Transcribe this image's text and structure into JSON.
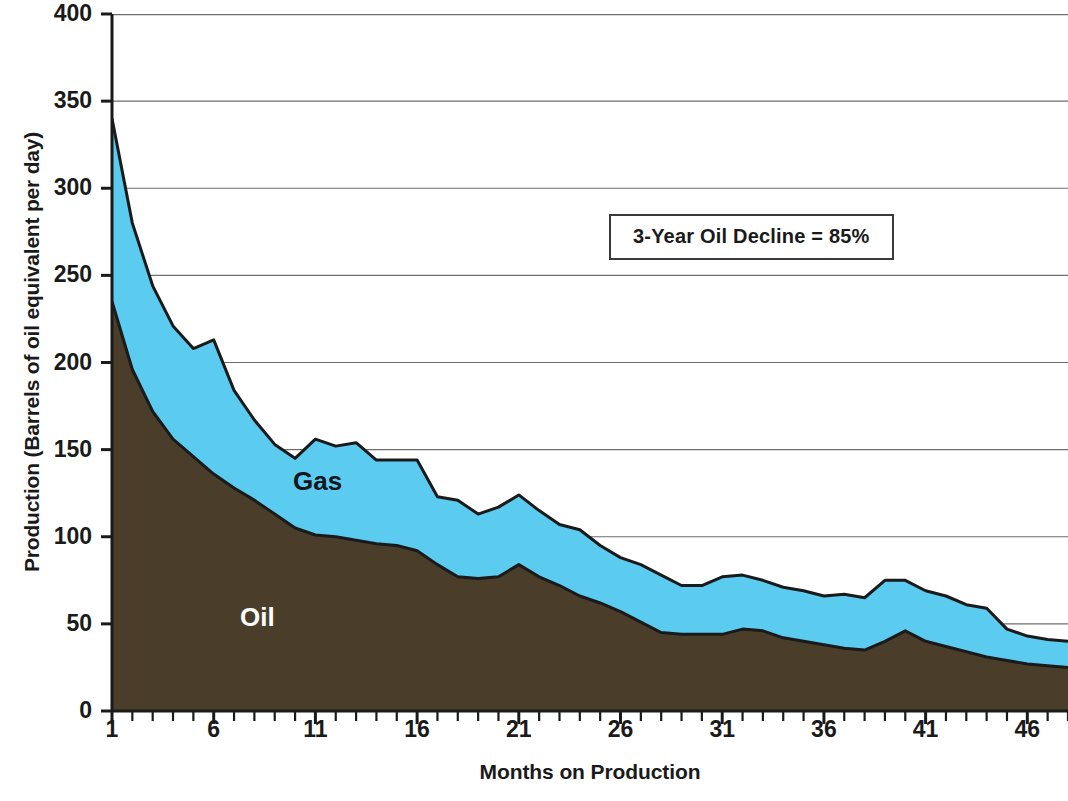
{
  "chart_data": {
    "type": "area",
    "stacked": true,
    "title": "",
    "xlabel": "Months on Production",
    "ylabel": "Production (Barrels of oil equivalent per day)",
    "xlim": [
      1,
      48
    ],
    "ylim": [
      0,
      400
    ],
    "ytick_labels": [
      "0",
      "50",
      "100",
      "150",
      "200",
      "250",
      "300",
      "350",
      "400"
    ],
    "ytick_values": [
      0,
      50,
      100,
      150,
      200,
      250,
      300,
      350,
      400
    ],
    "xtick_labels": [
      "1",
      "6",
      "11",
      "16",
      "21",
      "26",
      "31",
      "36",
      "41",
      "46"
    ],
    "xtick_values": [
      1,
      6,
      11,
      16,
      21,
      26,
      31,
      36,
      41,
      46
    ],
    "grid": "horizontal",
    "legend_position": "inline-labels",
    "x": [
      1,
      2,
      3,
      4,
      5,
      6,
      7,
      8,
      9,
      10,
      11,
      12,
      13,
      14,
      15,
      16,
      17,
      18,
      19,
      20,
      21,
      22,
      23,
      24,
      25,
      26,
      27,
      28,
      29,
      30,
      31,
      32,
      33,
      34,
      35,
      36,
      37,
      38,
      39,
      40,
      41,
      42,
      43,
      44,
      45,
      46,
      47,
      48
    ],
    "series": [
      {
        "name": "Oil",
        "color": "#4a3e2a",
        "label_color": "#ffffff",
        "values": [
          235,
          196,
          172,
          156,
          146,
          136,
          128,
          121,
          113,
          105,
          101,
          100,
          98,
          96,
          95,
          92,
          84,
          77,
          76,
          77,
          84,
          77,
          72,
          66,
          62,
          57,
          51,
          45,
          44,
          44,
          44,
          47,
          46,
          42,
          40,
          38,
          36,
          35,
          40,
          46,
          40,
          37,
          34,
          31,
          29,
          27,
          26,
          25
        ]
      },
      {
        "name": "Gas",
        "color": "#5bcbf0",
        "label_color": "#10161c",
        "values": [
          105,
          84,
          72,
          65,
          62,
          77,
          56,
          46,
          40,
          40,
          55,
          52,
          56,
          48,
          49,
          52,
          39,
          44,
          37,
          40,
          40,
          38,
          35,
          38,
          33,
          31,
          33,
          33,
          28,
          28,
          33,
          31,
          29,
          29,
          29,
          28,
          31,
          30,
          35,
          29,
          29,
          29,
          27,
          28,
          18,
          16,
          15,
          15
        ]
      }
    ],
    "totals": [
      340,
      280,
      244,
      221,
      208,
      213,
      184,
      167,
      153,
      145,
      156,
      152,
      154,
      144,
      144,
      144,
      123,
      121,
      113,
      117,
      124,
      115,
      107,
      104,
      95,
      88,
      84,
      78,
      72,
      72,
      77,
      78,
      75,
      71,
      69,
      66,
      67,
      65,
      75,
      75,
      69,
      66,
      61,
      59,
      47,
      43,
      41,
      40
    ],
    "annotations": [
      {
        "text": "3-Year Oil Decline = 85%",
        "boxed": true
      }
    ]
  },
  "labels": {
    "y_axis_title": "Production (Barrels of oil equivalent per day)",
    "x_axis_title": "Months on Production",
    "series_oil": "Oil",
    "series_gas": "Gas",
    "annotation": "3-Year Oil Decline = 85%"
  },
  "colors": {
    "oil": "#4a3e2a",
    "gas": "#5bcbf0",
    "outline": "#1a1a1a",
    "grid": "#6e6e6e",
    "axis": "#1a1a1a",
    "background": "#ffffff"
  }
}
